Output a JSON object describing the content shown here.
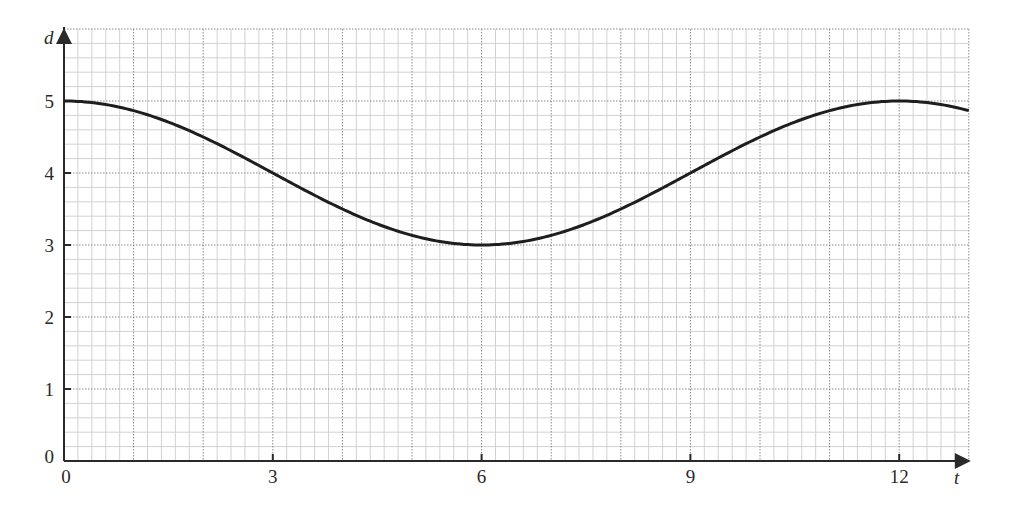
{
  "chart_data": {
    "type": "line",
    "title": "",
    "xlabel": "t",
    "ylabel": "d",
    "xlim": [
      0,
      13
    ],
    "ylim": [
      0,
      6
    ],
    "x_ticks": [
      0,
      3,
      6,
      9,
      12
    ],
    "x_tick_labels": [
      "0",
      "3",
      "6",
      "9",
      "12"
    ],
    "y_ticks": [
      0,
      1,
      2,
      3,
      4,
      5
    ],
    "y_tick_labels": [
      "0",
      "1",
      "2",
      "3",
      "4",
      "5"
    ],
    "grid": {
      "major_step_x": 1,
      "major_step_y": 1,
      "minor_subdivisions": 5,
      "major_style": "dotted",
      "on": true
    },
    "legend": null,
    "series": [
      {
        "name": "d(t)",
        "function": "d = 4 + cos(pi*t/6)",
        "x": [
          0,
          1,
          2,
          3,
          4,
          5,
          6,
          7,
          8,
          9,
          10,
          11,
          12,
          13
        ],
        "values": [
          5,
          4.87,
          4.5,
          4,
          3.5,
          3.13,
          3,
          3.13,
          3.5,
          4,
          4.5,
          4.87,
          5,
          4.87
        ]
      }
    ]
  },
  "colors": {
    "curve": "#1e1e1e",
    "axis": "#2a2a2a",
    "major_grid": "#8a8a8a",
    "minor_grid": "#d2d2d2",
    "background": "#ffffff"
  }
}
